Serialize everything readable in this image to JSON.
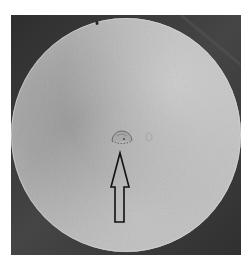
{
  "image": {
    "kind": "grayscale photograph",
    "subject": "circular metal disc specimen with central defect",
    "background_color": "#3b3b3b",
    "disc": {
      "center": [
        115,
        120
      ],
      "radius_x": 115,
      "radius_y": 117,
      "base_color": "#b2b2b2",
      "light_region_color": "#c8c8c8",
      "dark_region_color": "#979797"
    },
    "defect": {
      "description": "small semicircular pit near center",
      "center": [
        111,
        122
      ],
      "radius": 10
    },
    "edge_mark": {
      "description": "small dark spot near top edge",
      "center": [
        86,
        8
      ]
    },
    "arrow": {
      "direction": "up",
      "style": "outlined, black stroke, unfilled",
      "stroke_color": "#111111",
      "tip": [
        109,
        138
      ],
      "head_base_y": 172,
      "head_left_x": 100,
      "head_right_x": 118,
      "shaft_left_x": 104,
      "shaft_right_x": 113,
      "bottom_y": 207
    }
  }
}
